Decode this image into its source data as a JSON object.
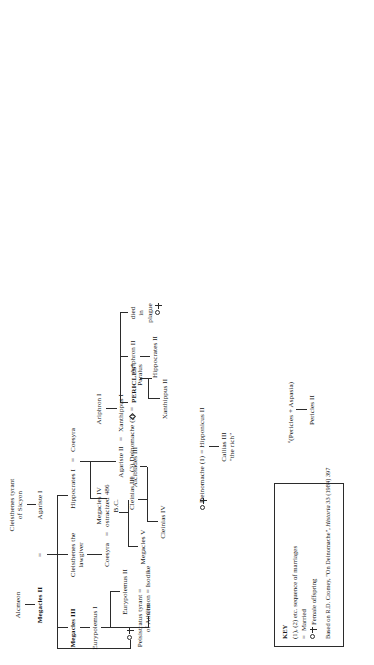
{
  "figure": {
    "type": "genealogical-family-tree",
    "orientation": "rotated-90-ccw"
  },
  "nodes": {
    "alcmeon": "Alcmeon",
    "megacles_ii": "Megacles II",
    "cleisthenes_sicyon": "Cleisthenes tyrant\nof Sicyon",
    "agariste_i": "Agariste I",
    "megacles_iii": "Megacles III",
    "cleisthenes_lawgiver": "Cleisthenes the\nlawgiver",
    "hippocrates_i": "Hippocrates I",
    "coesyra_top": "Coesyra",
    "ariphron_i": "Ariphron I",
    "eurypolemus_i": "Eurypolemus I",
    "coesyra_left": "Coesyra",
    "megacles_iv": "Megacles IV\nostracized 486\nB.C.",
    "agariste_ii": "Agariste II",
    "xanthippus_i": "Xanthippus I",
    "peisistratus": "Peisistratus tyrant =\nof Athens",
    "eurypolemus_ii": "Eurypolemus II",
    "megacles_v": "Megacles V",
    "cleinias_iii": "Cleinias III",
    "deinomache_2": "(3) Deinomache (2)",
    "pericles": "PERICLES",
    "pericles_sup": "a",
    "ariphron_ii": "Ariphron II",
    "died_in_plague": "died\nin\nplague",
    "cimon_isodike": "Cimon = Isodike",
    "cleinias_iv": "Cleinias IV",
    "alcibiades_iii": "Alcibiades III",
    "xanthippus_ii": "Xanthippus II",
    "paralus": "Paralus",
    "hippocrates_ii": "Hippocrates II",
    "deinomache_1": "Deinomache (1) = Hipponicus II",
    "callias_iii": "Callias III\n\"the rich\"",
    "pericles_aspasia": "(Pericles + Aspasia)",
    "pericles_aspasia_sup": "a",
    "pericles_ii": "Pericles II",
    "equals": "=",
    "tree_root_equals": "="
  },
  "key": {
    "title": "KEY",
    "rows": [
      "(1), (2) etc. sequence of marriages",
      "Married",
      "Female offspring"
    ],
    "married_symbol": "=",
    "female_symbol": "circle-cross",
    "source_prefix": "Based on R.D. Cromey, \"On Deinomache\", ",
    "source_italic": "Historia",
    "source_suffix": " 33 (1984) 397"
  },
  "colors": {
    "ink": "#161616",
    "line": "#2b2b2b",
    "background": "#ffffff"
  }
}
